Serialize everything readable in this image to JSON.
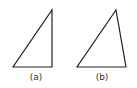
{
  "diagram": {
    "stroke_color": "#222222",
    "background": "#ffffff",
    "figures": [
      {
        "id": "a",
        "label": "(a)",
        "shape": "right-triangle",
        "points": [
          [
            13,
            67
          ],
          [
            52,
            67
          ],
          [
            52,
            10
          ]
        ],
        "label_pos": [
          36,
          73
        ]
      },
      {
        "id": "b",
        "label": "(b)",
        "shape": "acute-triangle",
        "points": [
          [
            77,
            67
          ],
          [
            126,
            67
          ],
          [
            116,
            10
          ]
        ],
        "label_pos": [
          102,
          73
        ]
      }
    ]
  }
}
